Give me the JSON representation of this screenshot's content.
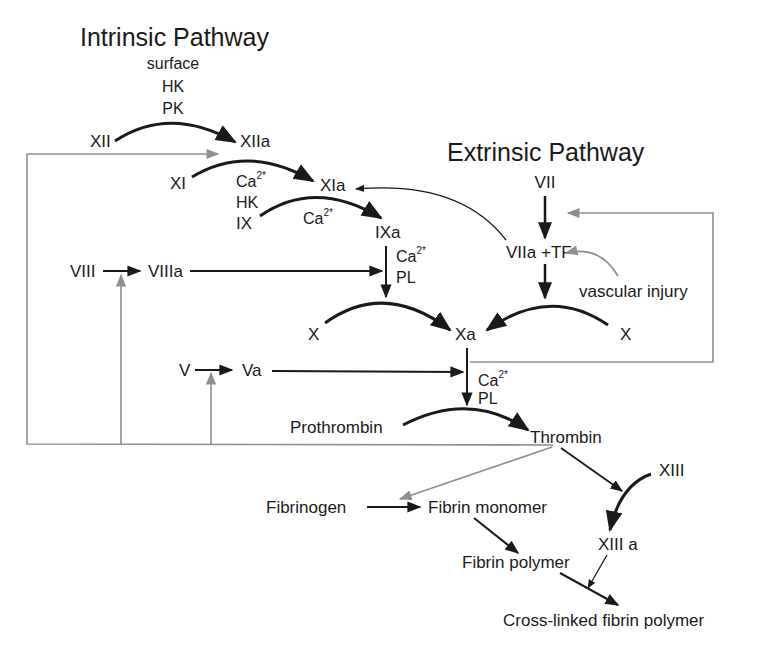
{
  "diagram": {
    "titles": {
      "intrinsic": "Intrinsic Pathway",
      "extrinsic": "Extrinsic Pathway"
    },
    "intrinsic_cofactors": {
      "surface": "surface",
      "hk": "HK",
      "pk": "PK"
    },
    "nodes": {
      "xii": "XII",
      "xiia": "XIIa",
      "xi": "XI",
      "xia": "XIa",
      "ix": "IX",
      "ixa": "IXa",
      "viii": "VIII",
      "viiia": "VIIIa",
      "x_left": "X",
      "xa": "Xa",
      "x_right": "X",
      "v": "V",
      "va": "Va",
      "vii": "VII",
      "viia_tf": "VIIa +TF",
      "vascular_injury": "vascular injury",
      "prothrombin": "Prothrombin",
      "thrombin": "Thrombin",
      "fibrinogen": "Fibrinogen",
      "fibrin_monomer": "Fibrin monomer",
      "fibrin_polymer": "Fibrin polymer",
      "xiii": "XIII",
      "xiiia": "XIII a",
      "cross_linked": "Cross-linked fibrin polymer"
    },
    "cofactors": {
      "xi_step_ca": "Ca",
      "xi_step_ca_sup": "2*",
      "xi_step_hk": "HK",
      "ix_step_ca": "Ca",
      "ix_step_ca_sup": "2*",
      "x_step_ca": "Ca",
      "x_step_ca_sup": "2*",
      "x_step_pl": "PL",
      "prothrombin_step_ca": "Ca",
      "prothrombin_step_ca_sup": "2*",
      "prothrombin_step_pl": "PL"
    },
    "colors": {
      "main_arrow": "#1a1a1a",
      "feedback_arrow": "#8f8f8f",
      "background": "#ffffff"
    }
  }
}
